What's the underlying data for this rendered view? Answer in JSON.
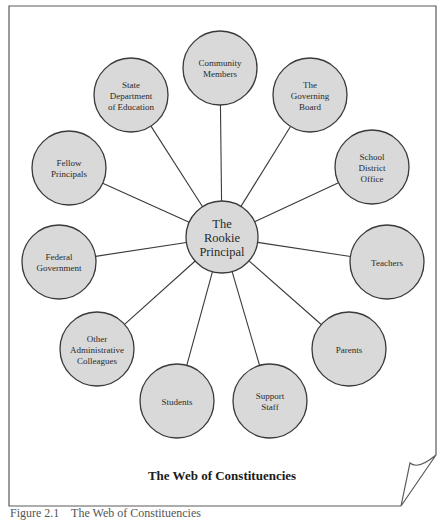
{
  "diagram": {
    "title": "The Web of Constituencies",
    "center": {
      "lines": [
        "The",
        "Rookie",
        "Principal"
      ],
      "x": 222,
      "y": 237,
      "r": 36
    },
    "nodes": [
      {
        "id": "community-members",
        "lines": [
          "Community",
          "Members"
        ],
        "x": 220,
        "y": 68
      },
      {
        "id": "governing-board",
        "lines": [
          "The",
          "Governing",
          "Board"
        ],
        "x": 310,
        "y": 95
      },
      {
        "id": "school-district-office",
        "lines": [
          "School",
          "District",
          "Office"
        ],
        "x": 372,
        "y": 167
      },
      {
        "id": "teachers",
        "lines": [
          "Teachers"
        ],
        "x": 387,
        "y": 262
      },
      {
        "id": "parents",
        "lines": [
          "Parents"
        ],
        "x": 349,
        "y": 349
      },
      {
        "id": "support-staff",
        "lines": [
          "Support",
          "Staff"
        ],
        "x": 270,
        "y": 401
      },
      {
        "id": "students",
        "lines": [
          "Students"
        ],
        "x": 177,
        "y": 401
      },
      {
        "id": "other-administrative-colleagues",
        "lines": [
          "Other",
          "Administrative",
          "Colleagues"
        ],
        "x": 97,
        "y": 349
      },
      {
        "id": "federal-government",
        "lines": [
          "Federal",
          "Government"
        ],
        "x": 59,
        "y": 262
      },
      {
        "id": "fellow-principals",
        "lines": [
          "Fellow",
          "Principals"
        ],
        "x": 69,
        "y": 168
      },
      {
        "id": "state-department-of-education",
        "lines": [
          "State",
          "Department",
          "of Education"
        ],
        "x": 131,
        "y": 95
      }
    ],
    "node_radius": 37,
    "colors": {
      "node_fill": "#d9d9d9",
      "stroke": "#3a3a3a",
      "page_edge": "#5a5a5a"
    }
  },
  "caption": "Figure 2.1    The Web of Constituencies"
}
